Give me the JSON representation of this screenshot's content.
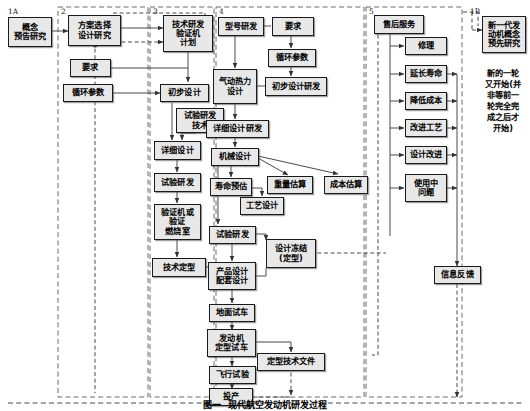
{
  "figure": {
    "caption": "图一  现代航空发动机研发过程",
    "sections": [
      {
        "id": "1A",
        "label": "1A"
      },
      {
        "id": "2",
        "label": "2"
      },
      {
        "id": "3",
        "label": "3"
      },
      {
        "id": "4",
        "label": "4"
      },
      {
        "id": "5",
        "label": "5"
      },
      {
        "id": "1B",
        "label": "1B"
      }
    ],
    "nodes": [
      {
        "key": "gainian",
        "text": "概念\n预告研究"
      },
      {
        "key": "fangan",
        "text": "方案选择\n设计研究"
      },
      {
        "key": "jishuyanfa",
        "text": "技术研发\n验证机\n计划"
      },
      {
        "key": "yaoqiu_left",
        "text": "要求"
      },
      {
        "key": "xunhuan_left",
        "text": "循环参数"
      },
      {
        "key": "chubu_left",
        "text": "初步设计"
      },
      {
        "key": "shiyanjishu",
        "text": "试验研发\n技术"
      },
      {
        "key": "xiangxi_left",
        "text": "详细设计"
      },
      {
        "key": "shiyan_left",
        "text": "试验研发"
      },
      {
        "key": "yanzhengji",
        "text": "验证机或\n验证\n燃烧室"
      },
      {
        "key": "jishudingxing",
        "text": "技术定型"
      },
      {
        "key": "xinghao",
        "text": "型号研发"
      },
      {
        "key": "yaoqiu_right",
        "text": "要求"
      },
      {
        "key": "xunhuan_right",
        "text": "循环参数"
      },
      {
        "key": "qidongrli",
        "text": "气动热力\n设计"
      },
      {
        "key": "chubu_right",
        "text": "初步设计研发"
      },
      {
        "key": "xiangxi_right",
        "text": "详细设计研发"
      },
      {
        "key": "jixie",
        "text": "机械设计"
      },
      {
        "key": "shouming",
        "text": "寿命预估"
      },
      {
        "key": "zhongliang",
        "text": "重量估算"
      },
      {
        "key": "chengben",
        "text": "成本估算"
      },
      {
        "key": "gongyi",
        "text": "工艺设计"
      },
      {
        "key": "shiyan_right",
        "text": "试验研发"
      },
      {
        "key": "sheji_dongjie",
        "text": "设计冻结\n(定型)"
      },
      {
        "key": "chanpin",
        "text": "产品设计\n配套设计"
      },
      {
        "key": "dimian",
        "text": "地面试车"
      },
      {
        "key": "fadongji",
        "text": "发动机\n定型试车"
      },
      {
        "key": "dingxingwenjian",
        "text": "定型技术文件"
      },
      {
        "key": "feixing",
        "text": "飞行试验"
      },
      {
        "key": "touchan",
        "text": "投产"
      },
      {
        "key": "shouhou",
        "text": "售后服务"
      },
      {
        "key": "xiuli",
        "text": "修理"
      },
      {
        "key": "yanchang",
        "text": "延长寿命"
      },
      {
        "key": "jiangdi",
        "text": "降低成本"
      },
      {
        "key": "gaijin_gongyi",
        "text": "改进工艺"
      },
      {
        "key": "shejigaijin",
        "text": "设计改进"
      },
      {
        "key": "shiyongzhong",
        "text": "使用中\n问题"
      },
      {
        "key": "xinxifankui",
        "text": "信息反馈"
      },
      {
        "key": "xinyidai",
        "text": "新一代发\n动机概念\n预先研究"
      }
    ],
    "annotation": "新的一轮\n又开始(并\n非等前一\n轮完全完\n成之后才\n开始)",
    "colors": {
      "node_fill": "#e8e8e8",
      "node_border": "#1a1a1a",
      "line": "#4a4a4a",
      "dashed_boundary": "#6a6a6a",
      "text": "#000000"
    }
  }
}
